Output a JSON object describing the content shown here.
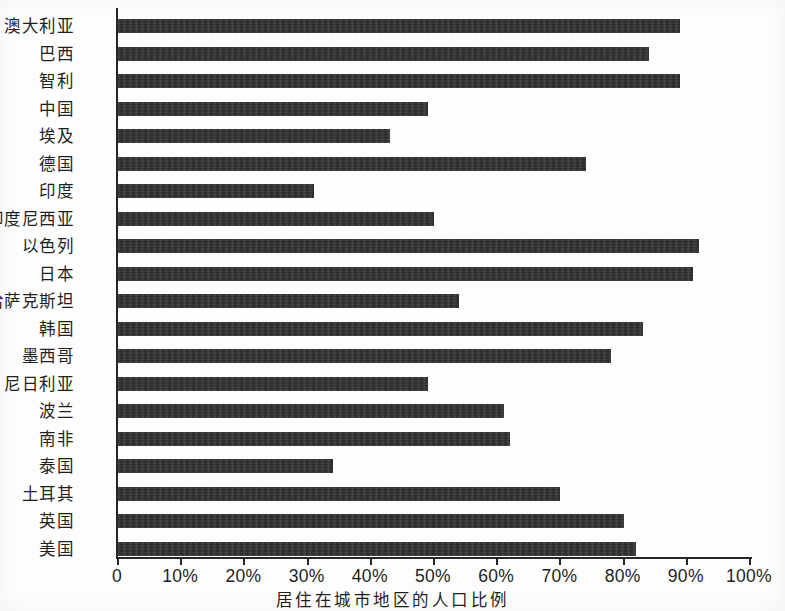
{
  "chart_data": {
    "type": "bar",
    "orientation": "horizontal",
    "title": "",
    "xlabel": "居住在城市地区的人口比例",
    "ylabel": "",
    "xlim": [
      0,
      100
    ],
    "xticks": [
      "0",
      "10%",
      "20%",
      "30%",
      "40%",
      "50%",
      "60%",
      "70%",
      "80%",
      "90%",
      "100%"
    ],
    "xtick_values": [
      0,
      10,
      20,
      30,
      40,
      50,
      60,
      70,
      80,
      90,
      100
    ],
    "grid": false,
    "legend": false,
    "bar_color": "#2e2e2e",
    "categories": [
      "澳大利亚",
      "巴西",
      "智利",
      "中国",
      "埃及",
      "德国",
      "印度",
      "印度尼西亚",
      "以色列",
      "日本",
      "哈萨克斯坦",
      "韩国",
      "墨西哥",
      "尼日利亚",
      "波兰",
      "南非",
      "泰国",
      "土耳其",
      "英国",
      "美国"
    ],
    "values": [
      89,
      84,
      89,
      49,
      43,
      74,
      31,
      50,
      92,
      91,
      54,
      83,
      78,
      49,
      61,
      62,
      34,
      70,
      80,
      82
    ]
  }
}
